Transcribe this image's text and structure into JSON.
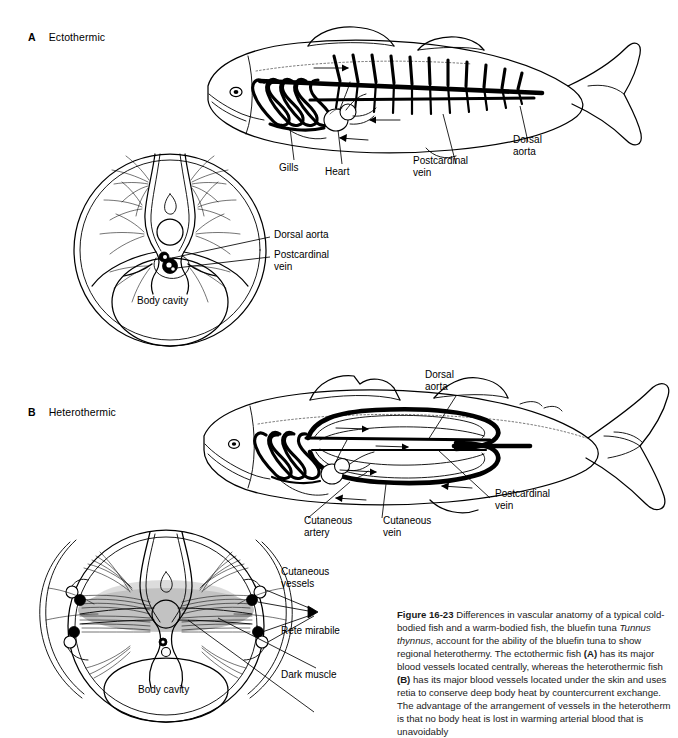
{
  "figure": {
    "number": "Figure 16-23",
    "caption_text": " Differences in vascular anatomy of a typical cold-bodied fish and a warm-bodied fish, the bluefin tuna ",
    "species": "Tunnus thynnus",
    "caption_text2": ", account for the ability of the bluefin tuna to show regional heterothermy. The ectothermic fish ",
    "bold_a": "(A)",
    "caption_text3": " has its major blood vessels located centrally, whereas the heterothermic fish ",
    "bold_b": "(B)",
    "caption_text4": " has its major blood vessels located under the skin and uses retia to conserve deep body heat by countercurrent exchange. The advantage of the arrangement of vessels in the heterotherm is that no body heat is lost in warming arterial blood that is unavoidably"
  },
  "panels": {
    "a": {
      "letter": "A",
      "title": "Ectothermic"
    },
    "b": {
      "letter": "B",
      "title": "Heterothermic"
    }
  },
  "labels": {
    "a_fish": {
      "gills": "Gills",
      "heart": "Heart",
      "postcardinal_vein": "Postcardinal\nvein",
      "dorsal_aorta": "Dorsal\naorta"
    },
    "a_section": {
      "dorsal_aorta": "Dorsal aorta",
      "postcardinal_vein": "Postcardinal\nvein",
      "body_cavity": "Body cavity"
    },
    "b_fish": {
      "dorsal_aorta": "Dorsal\naorta",
      "postcardinal_vein": "Postcardinal\nvein",
      "cutaneous_artery": "Cutaneous\nartery",
      "cutaneous_vein": "Cutaneous\nvein"
    },
    "b_section": {
      "cutaneous_vessels": "Cutaneous\nvessels",
      "rete_mirabile": "Rete mirabile",
      "dark_muscle": "Dark muscle",
      "body_cavity": "Body cavity"
    }
  },
  "colors": {
    "ink": "#000000",
    "background": "#ffffff",
    "dark_muscle_shading": "#b2b2b2"
  }
}
